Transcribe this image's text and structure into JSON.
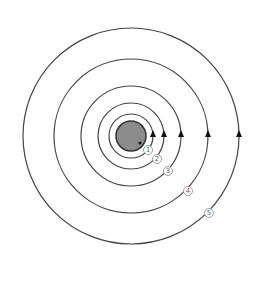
{
  "diagram": {
    "type": "concentric-orbits",
    "center": {
      "x": 131,
      "y": 136
    },
    "planet": {
      "radius": 15,
      "fill": "#8c8c8c",
      "stroke": "#333333",
      "dot": {
        "dx": 9,
        "dy": 7
      }
    },
    "orbits": [
      {
        "id": 1,
        "label": "1",
        "radius": 22,
        "arrow_x": 153,
        "label_pos": {
          "x": 148,
          "y": 150
        }
      },
      {
        "id": 2,
        "label": "2",
        "radius": 33,
        "arrow_x": 164,
        "label_pos": {
          "x": 157,
          "y": 159
        }
      },
      {
        "id": 3,
        "label": "3",
        "radius": 50,
        "arrow_x": 181,
        "label_pos": {
          "x": 168,
          "y": 171
        }
      },
      {
        "id": 4,
        "label": "4",
        "radius": 77,
        "arrow_x": 208,
        "label_pos": {
          "x": 188,
          "y": 191
        }
      },
      {
        "id": 5,
        "label": "5",
        "radius": 108,
        "arrow_x": 239,
        "label_pos": {
          "x": 209,
          "y": 213
        }
      }
    ],
    "arrow_direction": "up",
    "colors": {
      "orbit": "#444444",
      "arrow": "#111111",
      "label_text": "#666666"
    }
  }
}
